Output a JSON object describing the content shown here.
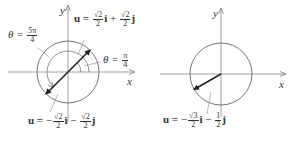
{
  "figures": [
    {
      "name": "left",
      "axes": {
        "x_label": "x",
        "y_label": "y"
      },
      "vector_upper": {
        "label_prefix": "u =",
        "i_coeff": {
          "num": "√2",
          "den": "2"
        },
        "i": "i",
        "op": "+",
        "j_coeff": {
          "num": "√2",
          "den": "2"
        },
        "j": "j"
      },
      "vector_lower": {
        "label_prefix": "u =",
        "sign": "−",
        "i_coeff": {
          "num": "√2",
          "den": "2"
        },
        "i": "i",
        "op": "−",
        "j_coeff": {
          "num": "√2",
          "den": "2"
        },
        "j": "j"
      },
      "angle_large": {
        "theta": "θ =",
        "num": "5π",
        "den": "4"
      },
      "angle_small": {
        "theta": "θ =",
        "num": "π",
        "den": "4"
      }
    },
    {
      "name": "right",
      "axes": {
        "x_label": "x",
        "y_label": "y"
      },
      "vector": {
        "label_prefix": "u =",
        "sign": "−",
        "i_coeff": {
          "num": "√3",
          "den": "2"
        },
        "i": "i",
        "op": "−",
        "j_coeff": {
          "num": "1",
          "den": "2"
        },
        "j": "j"
      }
    }
  ],
  "colors": {
    "line": "#555555",
    "vector": "#222222",
    "text": "#333333"
  }
}
